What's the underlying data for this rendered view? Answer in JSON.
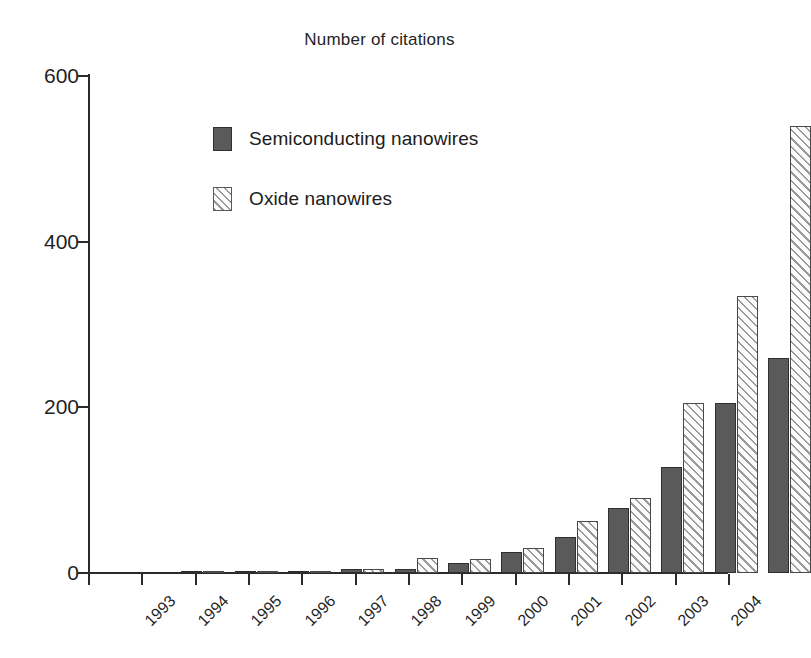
{
  "chart_data": {
    "type": "bar",
    "title": "Number of citations",
    "xlabel": "",
    "ylabel": "",
    "ylim": [
      0,
      600
    ],
    "yticks": [
      0,
      200,
      400,
      600
    ],
    "grid": false,
    "legend_position": "upper-left-inside",
    "categories": [
      "1993",
      "1994",
      "1995",
      "1996",
      "1997",
      "1998",
      "1999",
      "2000",
      "2001",
      "2002",
      "2003",
      "2004"
    ],
    "series": [
      {
        "name": "Semiconducting nanowires",
        "color": "#5a5a5a",
        "fill": "solid",
        "values": [
          2,
          2,
          2,
          5,
          5,
          12,
          25,
          43,
          78,
          128,
          205,
          260
        ]
      },
      {
        "name": "Oxide nanowires",
        "color": "#ffffff",
        "fill": "diagonal-hatch",
        "values": [
          1,
          1,
          3,
          5,
          18,
          17,
          30,
          63,
          90,
          205,
          335,
          540
        ]
      }
    ]
  },
  "axis": {
    "y_tick_labels": [
      "0",
      "200",
      "400",
      "600"
    ],
    "x_tick_labels": [
      "1993",
      "1994",
      "1995",
      "1996",
      "1997",
      "1998",
      "1999",
      "2000",
      "2001",
      "2002",
      "2003",
      "2004"
    ]
  },
  "legend": {
    "items": [
      {
        "label": "Semiconducting nanowires",
        "swatch": "solid-gray-swatch"
      },
      {
        "label": "Oxide nanowires",
        "swatch": "hatched-swatch"
      }
    ]
  }
}
